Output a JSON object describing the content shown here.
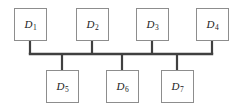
{
  "diagram": {
    "type": "bus-topology-network-diagram",
    "bus": {
      "name": "bus-line",
      "color": "#404040",
      "thickness": 2.4,
      "y": 54,
      "x_start": 30,
      "x_end": 212
    },
    "box": {
      "width": 33,
      "height": 33,
      "border_color": "#8d8d8d",
      "fill_color": "#ffffff"
    },
    "stub": {
      "color": "#404040",
      "thickness": 2.2
    },
    "nodes": [
      {
        "id": "d1",
        "label_letter": "D",
        "label_sub": "1",
        "row": "top",
        "box_x": 14,
        "box_y": 8,
        "stub_x": 30,
        "stub_y1": 41,
        "stub_y2": 54
      },
      {
        "id": "d2",
        "label_letter": "D",
        "label_sub": "2",
        "row": "top",
        "box_x": 76,
        "box_y": 8,
        "stub_x": 92,
        "stub_y1": 41,
        "stub_y2": 54
      },
      {
        "id": "d3",
        "label_letter": "D",
        "label_sub": "3",
        "row": "top",
        "box_x": 136,
        "box_y": 8,
        "stub_x": 152,
        "stub_y1": 41,
        "stub_y2": 54
      },
      {
        "id": "d4",
        "label_letter": "D",
        "label_sub": "4",
        "row": "top",
        "box_x": 196,
        "box_y": 8,
        "stub_x": 212,
        "stub_y1": 41,
        "stub_y2": 54
      },
      {
        "id": "d5",
        "label_letter": "D",
        "label_sub": "5",
        "row": "bottom",
        "box_x": 46,
        "box_y": 70,
        "stub_x": 62,
        "stub_y1": 54,
        "stub_y2": 70
      },
      {
        "id": "d6",
        "label_letter": "D",
        "label_sub": "6",
        "row": "bottom",
        "box_x": 106,
        "box_y": 70,
        "stub_x": 122,
        "stub_y1": 54,
        "stub_y2": 70
      },
      {
        "id": "d7",
        "label_letter": "D",
        "label_sub": "7",
        "row": "bottom",
        "box_x": 161,
        "box_y": 70,
        "stub_x": 177,
        "stub_y1": 54,
        "stub_y2": 70
      }
    ]
  }
}
